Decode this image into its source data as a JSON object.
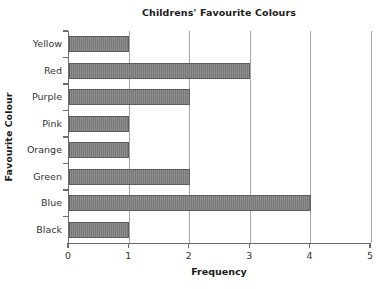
{
  "chart_data": {
    "type": "bar",
    "orientation": "horizontal",
    "title": "Childrens' Favourite Colours",
    "xlabel": "Frequency",
    "ylabel": "Favourite Colour",
    "categories": [
      "Yellow",
      "Red",
      "Purple",
      "Pink",
      "Orange",
      "Green",
      "Blue",
      "Black"
    ],
    "values": [
      1,
      3,
      2,
      1,
      1,
      2,
      4,
      1
    ],
    "xlim": [
      0,
      5
    ],
    "xticks": [
      "0",
      "1",
      "2",
      "3",
      "4",
      "5"
    ],
    "xtick_values": [
      0,
      1,
      2,
      3,
      4,
      5
    ],
    "grid": "vertical",
    "legend": "none",
    "bar_color": "#787878",
    "bar_edge_color": "#5d5d5d",
    "gridline_color": "#a8a8a8",
    "axis_color": "#6b6b6b",
    "background_color": "#ffffff",
    "text_color": "#333333"
  }
}
